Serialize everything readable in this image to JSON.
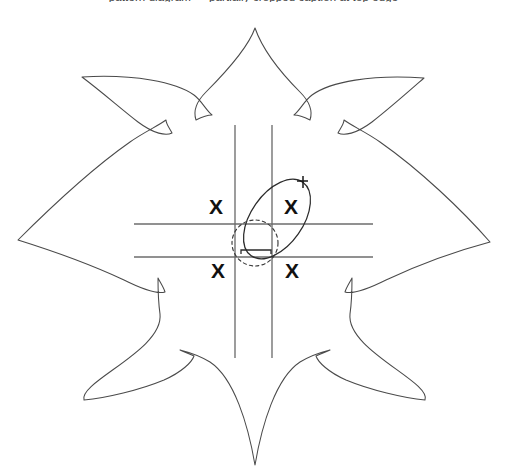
{
  "figure": {
    "caption_clipped": "pattern diagram — partially cropped caption at top edge",
    "background_color": "#ffffff",
    "outline_color": "#4a4a4a",
    "fold_line_color": "#6d6d6d",
    "mark_color": "#1a1a1a",
    "canvas": {
      "width": 507,
      "height": 471
    }
  },
  "flower": {
    "petal_count": 6,
    "center": {
      "x": 254,
      "y": 241
    },
    "description": "six pointed leaf-shaped petals radiating from a common center",
    "petal_tips": [
      {
        "name": "petal-tip-top",
        "x": 255,
        "y": 28
      },
      {
        "name": "petal-tip-upper-left",
        "x": 82,
        "y": 77
      },
      {
        "name": "petal-tip-upper-right",
        "x": 424,
        "y": 78
      },
      {
        "name": "petal-tip-left",
        "x": 18,
        "y": 240
      },
      {
        "name": "petal-tip-right",
        "x": 490,
        "y": 242
      },
      {
        "name": "petal-tip-lower-left",
        "x": 84,
        "y": 400
      },
      {
        "name": "petal-tip-lower-right",
        "x": 425,
        "y": 400
      },
      {
        "name": "petal-tip-bottom",
        "x": 255,
        "y": 465
      }
    ]
  },
  "grid": {
    "description": "two vertical and two horizontal fold lines forming a central square",
    "vertical_lines": [
      {
        "name": "fold-line-vertical-left",
        "x": 235,
        "y1": 125,
        "y2": 358
      },
      {
        "name": "fold-line-vertical-right",
        "x": 272,
        "y1": 125,
        "y2": 358
      }
    ],
    "horizontal_lines": [
      {
        "name": "fold-line-horizontal-top",
        "y": 224,
        "x1": 134,
        "x2": 373
      },
      {
        "name": "fold-line-horizontal-bottom",
        "y": 257,
        "x1": 134,
        "x2": 373
      }
    ]
  },
  "markers": {
    "x_marks": [
      {
        "name": "x-mark-top-left",
        "label": "X",
        "x": 216,
        "y": 207
      },
      {
        "name": "x-mark-top-right",
        "label": "X",
        "x": 291,
        "y": 207
      },
      {
        "name": "x-mark-bottom-left",
        "label": "X",
        "x": 218,
        "y": 271
      },
      {
        "name": "x-mark-bottom-right",
        "label": "X",
        "x": 292,
        "y": 271
      }
    ],
    "solid_ellipse": {
      "name": "solid-ellipse-mark",
      "cx": 277,
      "cy": 219,
      "rx": 26,
      "ry": 45,
      "rotation_deg": 35
    },
    "dashed_circle": {
      "name": "dashed-circle-mark",
      "cx": 255,
      "cy": 243,
      "r": 23
    },
    "arrow": {
      "name": "direction-arrow-icon",
      "x": 303,
      "y": 182
    },
    "hook": {
      "name": "hook-bracket-mark",
      "x": 244,
      "y": 249
    }
  }
}
